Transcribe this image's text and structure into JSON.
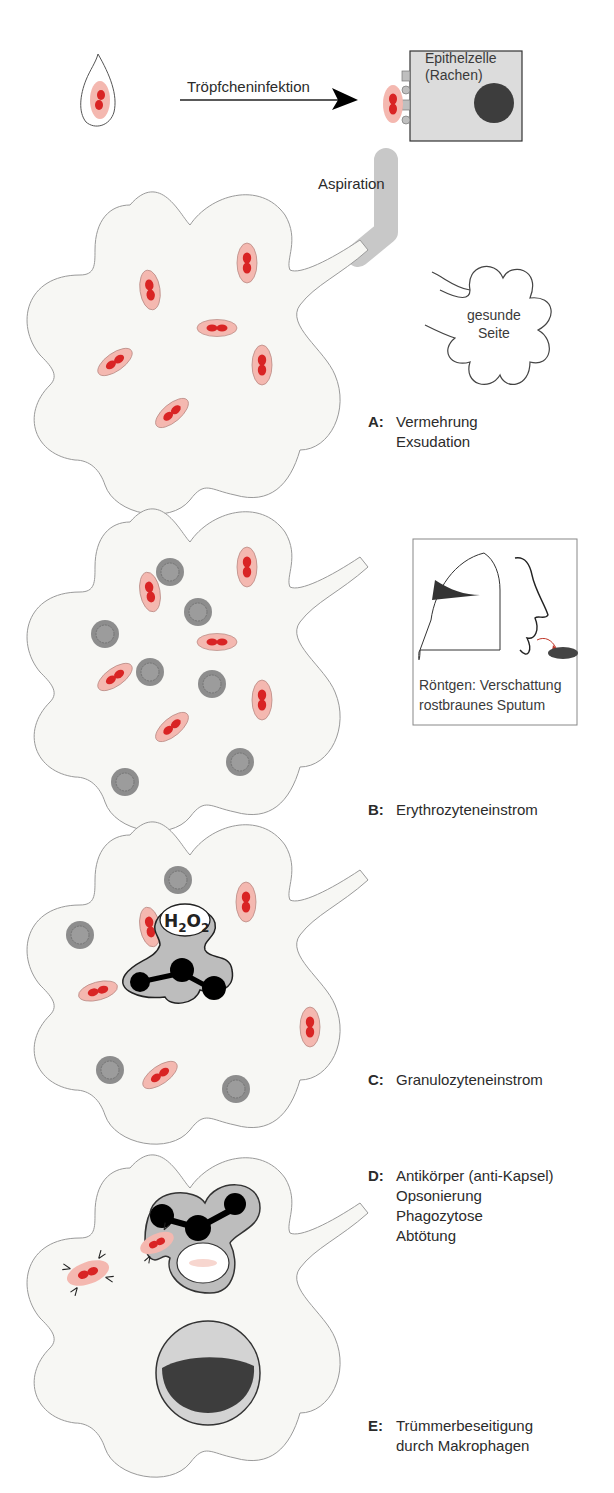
{
  "figure": {
    "top": {
      "transmission_label": "Tröpfcheninfektion",
      "epithelial_label_line1": "Epithelzelle",
      "epithelial_label_line2": "(Rachen)",
      "aspiration_label": "Aspiration",
      "healthy_side_line1": "gesunde",
      "healthy_side_line2": "Seite"
    },
    "panels": [
      {
        "key": "A:",
        "lines": [
          "Vermehrung",
          "Exsudation"
        ]
      },
      {
        "key": "B:",
        "lines": [
          "Erythrozyteneinstrom"
        ]
      },
      {
        "key": "C:",
        "lines": [
          "Granulozyteneinstrom"
        ]
      },
      {
        "key": "D:",
        "lines": [
          "Antikörper (anti-Kapsel)",
          "Opsonierung",
          "Phagozytose",
          "Abtötung"
        ]
      },
      {
        "key": "E:",
        "lines": [
          "Trümmerbeseitigung",
          "durch Makrophagen"
        ]
      }
    ],
    "inset": {
      "line1": "Röntgen: Verschattung",
      "line2": "rostbraunes Sputum"
    },
    "h2o2": {
      "H": "H",
      "sub1": "2",
      "O": "O",
      "sub2": "2"
    },
    "colors": {
      "bacteria_capsule": "#f4b8b0",
      "bacteria_core": "#d92424",
      "alveolus_fill": "#f7f7f4",
      "erythrocyte": "#8d8d8d",
      "granulocyte_fill": "#bdbdbd",
      "nucleus": "#000000",
      "epithelial_fill": "#dcdcdc",
      "macrophage_nucleus": "#3d3d3d"
    }
  }
}
